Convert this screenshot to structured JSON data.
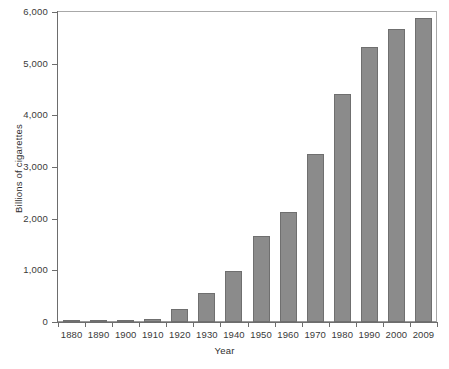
{
  "chart_data": {
    "type": "bar",
    "title": "",
    "xlabel": "Year",
    "ylabel": "Billions of cigarettes",
    "categories": [
      "1880",
      "1890",
      "1900",
      "1910",
      "1920",
      "1930",
      "1940",
      "1950",
      "1960",
      "1970",
      "1980",
      "1990",
      "2000",
      "2009"
    ],
    "values": [
      3,
      4,
      28,
      65,
      245,
      560,
      985,
      1660,
      2130,
      3250,
      4410,
      5320,
      5680,
      5880
    ],
    "ylim": [
      0,
      6000
    ],
    "ytick_values": [
      0,
      1000,
      2000,
      3000,
      4000,
      5000,
      6000
    ],
    "ytick_labels": [
      "0",
      "1,000",
      "2,000",
      "3,000",
      "4,000",
      "5,000",
      "6,000"
    ],
    "grid": false,
    "legend": null,
    "series": [
      {
        "name": "Cigarette consumption",
        "values": [
          3,
          4,
          28,
          65,
          245,
          560,
          985,
          1660,
          2130,
          3250,
          4410,
          5320,
          5680,
          5880
        ]
      }
    ],
    "colors": {
      "bar_fill": "#8b8b8b",
      "bar_edge": "#6f6f6f",
      "axis": "#6d6d6d",
      "frame": "#a8a8a8",
      "text": "#3a3a3a",
      "background": "#ffffff"
    }
  }
}
